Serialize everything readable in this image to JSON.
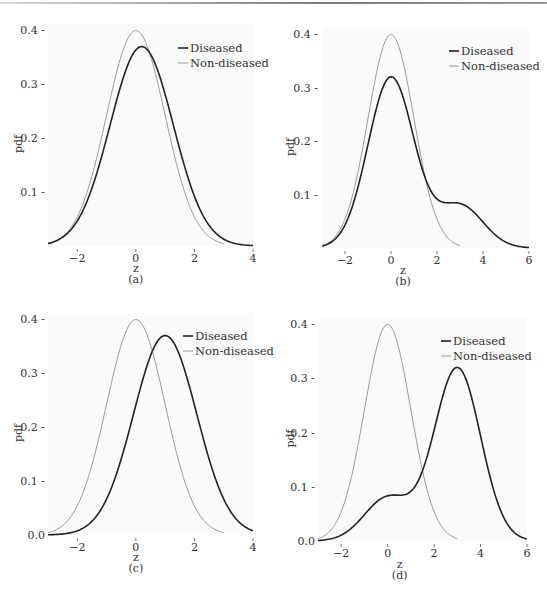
{
  "figure": {
    "panels": [
      "(a)",
      "(b)",
      "(c)",
      "(d)"
    ]
  },
  "chart_data": [
    {
      "id": "a",
      "type": "line",
      "panel_label": "(a)",
      "xlabel": "z",
      "ylabel": "pdf",
      "xlim": [
        -3,
        4
      ],
      "ylim": [
        0,
        0.4
      ],
      "x_ticks": [
        "-2",
        "0",
        "2",
        "4"
      ],
      "x_tick_values": [
        -2,
        0,
        2,
        4
      ],
      "y_ticks": [
        "0.1",
        "0.2",
        "0.3",
        "0.4"
      ],
      "y_tick_values": [
        0.1,
        0.2,
        0.3,
        0.4
      ],
      "grid": false,
      "legend_position": "upper right",
      "series": [
        {
          "name": "Diseased",
          "color": "#222222",
          "width": 1.6,
          "dist": "mixture",
          "components": [
            {
              "w": 1.0,
              "mu": 0.2,
              "sd": 1.08
            }
          ],
          "x_range": [
            -3,
            4
          ]
        },
        {
          "name": "Non-diseased",
          "color": "#9a9a9a",
          "width": 1.0,
          "dist": "mixture",
          "components": [
            {
              "w": 1.0,
              "mu": 0.0,
              "sd": 1.0
            }
          ],
          "x_range": [
            -3,
            3
          ]
        }
      ],
      "peak_values": {
        "Diseased": 0.37,
        "Non-diseased": 0.4
      }
    },
    {
      "id": "b",
      "type": "line",
      "panel_label": "(b)",
      "xlabel": "z",
      "ylabel": "pdf",
      "xlim": [
        -3,
        6
      ],
      "ylim": [
        0,
        0.4
      ],
      "x_ticks": [
        "-2",
        "0",
        "2",
        "4",
        "6"
      ],
      "x_tick_values": [
        -2,
        0,
        2,
        4,
        6
      ],
      "y_ticks": [
        "0.1",
        "0.2",
        "0.3",
        "0.4"
      ],
      "y_tick_values": [
        0.1,
        0.2,
        0.3,
        0.4
      ],
      "grid": false,
      "legend_position": "upper right",
      "series": [
        {
          "name": "Diseased",
          "color": "#222222",
          "width": 1.6,
          "dist": "mixture",
          "components": [
            {
              "w": 0.8,
              "mu": 0.0,
              "sd": 1.0
            },
            {
              "w": 0.2,
              "mu": 3.0,
              "sd": 1.0
            }
          ],
          "x_range": [
            -3,
            6
          ]
        },
        {
          "name": "Non-diseased",
          "color": "#9a9a9a",
          "width": 1.0,
          "dist": "mixture",
          "components": [
            {
              "w": 1.0,
              "mu": 0.0,
              "sd": 1.0
            }
          ],
          "x_range": [
            -3,
            3
          ]
        }
      ],
      "peak_values": {
        "Diseased": 0.32,
        "Non-diseased": 0.4
      }
    },
    {
      "id": "c",
      "type": "line",
      "panel_label": "(c)",
      "xlabel": "z",
      "ylabel": "pdf",
      "xlim": [
        -3,
        4
      ],
      "ylim": [
        0,
        0.4
      ],
      "x_ticks": [
        "-2",
        "0",
        "2",
        "4"
      ],
      "x_tick_values": [
        -2,
        0,
        2,
        4
      ],
      "y_ticks": [
        "0.0",
        "0.1",
        "0.2",
        "0.3",
        "0.4"
      ],
      "y_tick_values": [
        0.0,
        0.1,
        0.2,
        0.3,
        0.4
      ],
      "grid": false,
      "legend_position": "upper right",
      "series": [
        {
          "name": "Diseased",
          "color": "#222222",
          "width": 1.6,
          "dist": "mixture",
          "components": [
            {
              "w": 1.0,
              "mu": 1.0,
              "sd": 1.08
            }
          ],
          "x_range": [
            -3,
            4
          ]
        },
        {
          "name": "Non-diseased",
          "color": "#9a9a9a",
          "width": 1.0,
          "dist": "mixture",
          "components": [
            {
              "w": 1.0,
              "mu": 0.0,
              "sd": 1.0
            }
          ],
          "x_range": [
            -3,
            3
          ]
        }
      ],
      "peak_values": {
        "Diseased": 0.37,
        "Non-diseased": 0.4
      }
    },
    {
      "id": "d",
      "type": "line",
      "panel_label": "(d)",
      "xlabel": "z",
      "ylabel": "pdf",
      "xlim": [
        -3,
        6
      ],
      "ylim": [
        0,
        0.4
      ],
      "x_ticks": [
        "-2",
        "0",
        "2",
        "4",
        "6"
      ],
      "x_tick_values": [
        -2,
        0,
        2,
        4,
        6
      ],
      "y_ticks": [
        "0.0",
        "0.1",
        "0.2",
        "0.3",
        "0.4"
      ],
      "y_tick_values": [
        0.0,
        0.1,
        0.2,
        0.3,
        0.4
      ],
      "grid": false,
      "legend_position": "upper right",
      "series": [
        {
          "name": "Diseased",
          "color": "#222222",
          "width": 1.6,
          "dist": "mixture",
          "components": [
            {
              "w": 0.2,
              "mu": 0.0,
              "sd": 1.0
            },
            {
              "w": 0.8,
              "mu": 3.0,
              "sd": 1.0
            }
          ],
          "x_range": [
            -3,
            6
          ]
        },
        {
          "name": "Non-diseased",
          "color": "#9a9a9a",
          "width": 1.0,
          "dist": "mixture",
          "components": [
            {
              "w": 1.0,
              "mu": 0.0,
              "sd": 1.0
            }
          ],
          "x_range": [
            -3,
            3
          ]
        }
      ],
      "peak_values": {
        "Diseased": 0.32,
        "Non-diseased": 0.4
      }
    }
  ]
}
